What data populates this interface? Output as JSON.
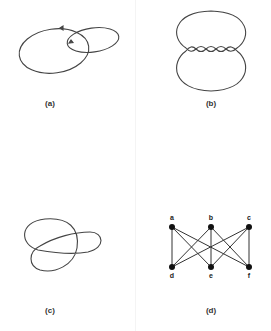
{
  "figures": [
    {
      "id": "a",
      "caption": "(a)",
      "description": "Two linked loops with direction arrows (Hopf link)"
    },
    {
      "id": "b",
      "caption": "(b)",
      "description": "Two lobes joined by a twisted band"
    },
    {
      "id": "c",
      "caption": "(c)",
      "description": "Trefoil knot"
    },
    {
      "id": "d",
      "caption": "(d)",
      "description": "Complete bipartite graph K3,3"
    }
  ],
  "graph": {
    "nodes": [
      {
        "id": "a",
        "label": "a"
      },
      {
        "id": "b",
        "label": "b"
      },
      {
        "id": "c",
        "label": "c"
      },
      {
        "id": "d",
        "label": "d"
      },
      {
        "id": "e",
        "label": "e"
      },
      {
        "id": "f",
        "label": "f"
      }
    ],
    "edges": [
      [
        "a",
        "d"
      ],
      [
        "a",
        "e"
      ],
      [
        "a",
        "f"
      ],
      [
        "b",
        "d"
      ],
      [
        "b",
        "e"
      ],
      [
        "b",
        "f"
      ],
      [
        "c",
        "d"
      ],
      [
        "c",
        "e"
      ],
      [
        "c",
        "f"
      ]
    ]
  },
  "colors": {
    "stroke": "#444444",
    "node": "#111111",
    "background": "#ffffff"
  }
}
